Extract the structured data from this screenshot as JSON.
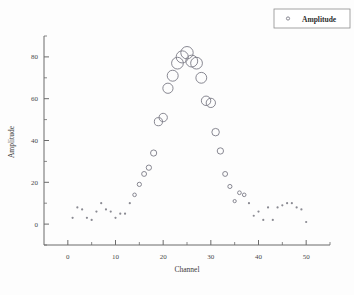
{
  "chart_data": {
    "type": "scatter",
    "title": "",
    "xlabel": "Channel",
    "ylabel": "Amplitude",
    "xlim": [
      -5,
      55
    ],
    "ylim": [
      -10,
      90
    ],
    "xticks": [
      0,
      10,
      20,
      30,
      40,
      50
    ],
    "yticks": [
      0,
      20,
      40,
      60,
      80
    ],
    "xtick_labels": [
      "0",
      "10",
      "20",
      "30",
      "40",
      "50"
    ],
    "ytick_labels": [
      "0",
      "20",
      "40",
      "60",
      "80"
    ],
    "minor_tick_step": 5,
    "grid": false,
    "legend": {
      "position": "top-right",
      "entries": [
        {
          "name": "Amplitude",
          "marker": "open-circle",
          "color": "#7a7a86"
        }
      ]
    },
    "marker_style": "open-circle-sized-by-value",
    "marker_color": "#7a7a86",
    "series": [
      {
        "name": "Amplitude",
        "x": [
          1,
          2,
          3,
          4,
          5,
          6,
          7,
          8,
          9,
          10,
          11,
          12,
          13,
          14,
          15,
          16,
          17,
          18,
          19,
          20,
          21,
          22,
          23,
          24,
          25,
          26,
          27,
          28,
          29,
          30,
          31,
          32,
          33,
          34,
          35,
          36,
          37,
          38,
          39,
          40,
          41,
          42,
          43,
          44,
          45,
          46,
          47,
          48,
          49,
          50
        ],
        "y": [
          3,
          8,
          7,
          3,
          2,
          6,
          10,
          7,
          6,
          3,
          5,
          5,
          10,
          14,
          19,
          24,
          27,
          34,
          49,
          51,
          65,
          71,
          77,
          80,
          82,
          78,
          77,
          70,
          59,
          58,
          44,
          35,
          24,
          18,
          11,
          15,
          14,
          10,
          4,
          6,
          2,
          8,
          2,
          8,
          9,
          10,
          10,
          8,
          7,
          1
        ]
      }
    ]
  }
}
